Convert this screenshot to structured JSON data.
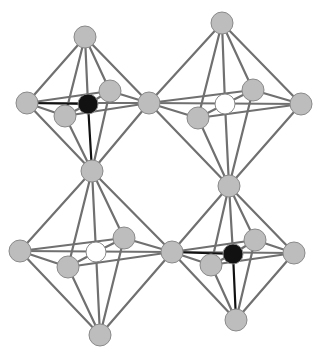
{
  "diagram": {
    "title": "",
    "description": "Corner-sharing octahedra crystal structure (4 octahedra in 2x2 arrangement)",
    "colors": {
      "background": "#ffffff",
      "bond": "#707070",
      "ligand_atom": "#bdbdbd",
      "ligand_stroke": "#8a8a8a",
      "center_dark": "#111111",
      "center_light": "#ffffff"
    },
    "octahedra": [
      {
        "id": "top-left",
        "center": {
          "x": 88,
          "y": 104,
          "type": "dark"
        },
        "vertices": {
          "top": {
            "x": 85,
            "y": 37
          },
          "left": {
            "x": 27,
            "y": 103
          },
          "right": {
            "x": 149,
            "y": 103
          },
          "back": {
            "x": 110,
            "y": 91
          },
          "front": {
            "x": 65,
            "y": 116
          },
          "bottom": {
            "x": 92,
            "y": 171
          }
        }
      },
      {
        "id": "top-right",
        "center": {
          "x": 225,
          "y": 104,
          "type": "light"
        },
        "vertices": {
          "top": {
            "x": 222,
            "y": 23
          },
          "left": {
            "x": 149,
            "y": 103
          },
          "right": {
            "x": 301,
            "y": 104
          },
          "back": {
            "x": 253,
            "y": 90
          },
          "front": {
            "x": 198,
            "y": 118
          },
          "bottom": {
            "x": 229,
            "y": 186
          }
        }
      },
      {
        "id": "bottom-left",
        "center": {
          "x": 96,
          "y": 252,
          "type": "light"
        },
        "vertices": {
          "top": {
            "x": 92,
            "y": 171
          },
          "left": {
            "x": 20,
            "y": 251
          },
          "right": {
            "x": 172,
            "y": 252
          },
          "back": {
            "x": 124,
            "y": 238
          },
          "front": {
            "x": 68,
            "y": 267
          },
          "bottom": {
            "x": 100,
            "y": 335
          }
        }
      },
      {
        "id": "bottom-right",
        "center": {
          "x": 233,
          "y": 254,
          "type": "dark"
        },
        "vertices": {
          "top": {
            "x": 229,
            "y": 186
          },
          "left": {
            "x": 172,
            "y": 252
          },
          "right": {
            "x": 294,
            "y": 253
          },
          "back": {
            "x": 255,
            "y": 240
          },
          "front": {
            "x": 211,
            "y": 265
          },
          "bottom": {
            "x": 236,
            "y": 320
          }
        }
      }
    ],
    "atom_radius": 11,
    "center_radius": 10
  }
}
